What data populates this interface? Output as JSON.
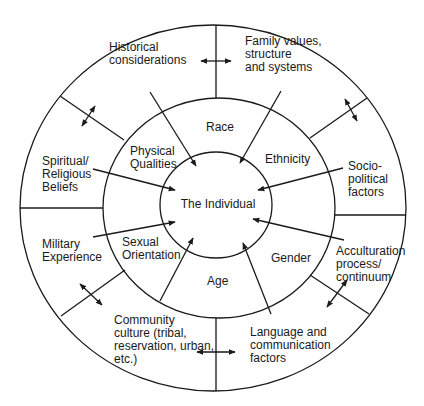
{
  "diagram": {
    "center_label": "The Individual",
    "middle_ring": [
      {
        "id": "race",
        "label": "Race"
      },
      {
        "id": "ethnicity",
        "label": "Ethnicity"
      },
      {
        "id": "gender",
        "label": "Gender"
      },
      {
        "id": "age",
        "label": "Age"
      },
      {
        "id": "sexual-orientation",
        "label": "Sexual\nOrientation"
      },
      {
        "id": "physical-qualities",
        "label": "Physical\nQualities"
      }
    ],
    "outer_ring": [
      {
        "id": "historical",
        "label": "Historical\nconsiderations"
      },
      {
        "id": "family",
        "label": "Family values,\nstructure\nand systems"
      },
      {
        "id": "sociopolitical",
        "label": "Socio-\npolitical\nfactors"
      },
      {
        "id": "acculturation",
        "label": "Acculturation\nprocess/\ncontinuum"
      },
      {
        "id": "language",
        "label": "Language and\ncommunication\nfactors"
      },
      {
        "id": "community",
        "label": "Community\nculture (tribal,\nreservation, urban,\netc.)"
      },
      {
        "id": "military",
        "label": "Military\nExperience"
      },
      {
        "id": "spiritual",
        "label": "Spiritual/\nReligious\nBeliefs"
      }
    ],
    "colors": {
      "stroke": "#1a1a1a",
      "background": "#ffffff"
    }
  }
}
